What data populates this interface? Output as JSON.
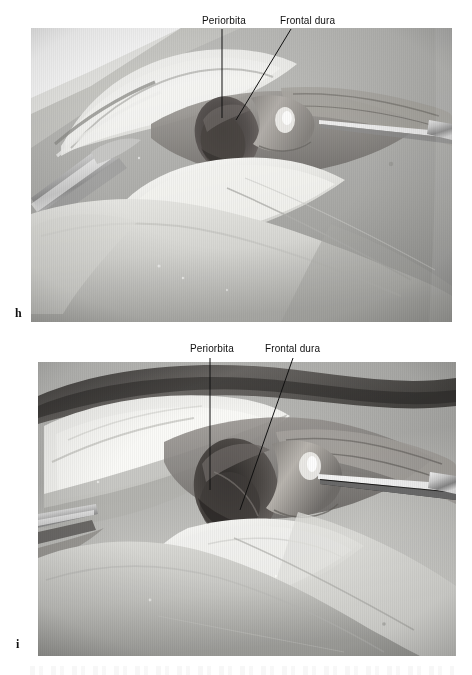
{
  "figure": {
    "type": "anatomical-dissection-photographs",
    "modality": "grayscale surgical photograph",
    "panel_count": 2,
    "panels": [
      {
        "letter": "h",
        "letter_x": 15,
        "letter_y": 307,
        "photo": {
          "x": 31,
          "y": 28,
          "width": 421,
          "height": 294
        },
        "annotations": [
          {
            "label": "Periorbita",
            "label_x": 202,
            "label_y": 15,
            "leader": {
              "x1": 222,
              "y1": 29,
              "x2": 222,
              "y2": 118
            }
          },
          {
            "label": "Frontal dura",
            "label_x": 280,
            "label_y": 15,
            "leader": {
              "x1": 291,
              "y1": 29,
              "x2": 236,
              "y2": 120
            }
          }
        ]
      },
      {
        "letter": "i",
        "letter_x": 16,
        "letter_y": 638,
        "photo": {
          "x": 38,
          "y": 362,
          "width": 418,
          "height": 294
        },
        "annotations": [
          {
            "label": "Periorbita",
            "label_x": 190,
            "label_y": 343,
            "leader": {
              "x1": 210,
              "y1": 358,
              "x2": 210,
              "y2": 490
            }
          },
          {
            "label": "Frontal dura",
            "label_x": 265,
            "label_y": 343,
            "leader": {
              "x1": 293,
              "y1": 358,
              "x2": 240,
              "y2": 510
            }
          }
        ]
      }
    ]
  },
  "colors": {
    "background": "#ffffff",
    "label_text": "#101010",
    "leader_line": "#111111",
    "panel_letter": "#111111",
    "photo_midtone": "#b9b9b9",
    "photo_highlight": "#f2f2ef",
    "photo_shadow": "#3a3a3a",
    "instrument_metal": "#dcdcdc"
  }
}
